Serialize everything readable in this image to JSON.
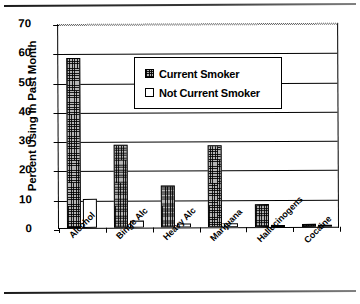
{
  "chart_data": {
    "type": "bar",
    "title": "",
    "xlabel": "",
    "ylabel": "Percent Using In Past Month",
    "ylim": [
      0,
      70
    ],
    "yticks": [
      0,
      10,
      20,
      30,
      40,
      50,
      60,
      70
    ],
    "grid": true,
    "legend_position": "inside-top-center",
    "categories": [
      "Alcohol",
      "Binge Alc",
      "Heavy Alc",
      "Marijuana",
      "Hallucinogens",
      "Cocaine"
    ],
    "series": [
      {
        "name": "Current Smoker",
        "values": [
          58,
          28.5,
          14.5,
          28,
          8,
          1.2
        ]
      },
      {
        "name": "Not Current Smoker",
        "values": [
          10,
          2.5,
          1.5,
          1.5,
          0.4,
          0.5
        ]
      }
    ]
  },
  "legend": {
    "items": [
      {
        "label": "Current Smoker",
        "swatch": "crosshatch-grey"
      },
      {
        "label": "Not Current Smoker",
        "swatch": "white"
      }
    ]
  },
  "axis": {
    "y_title": "Percent Using In Past Month",
    "y_tick_labels": [
      "70",
      "60",
      "50",
      "40",
      "30",
      "20",
      "10",
      "0"
    ],
    "x_tick_labels": [
      "Alcohol",
      "Binge Alc",
      "Heavy Alc",
      "Marijuana",
      "Hallucinogens",
      "Cocaine"
    ]
  }
}
